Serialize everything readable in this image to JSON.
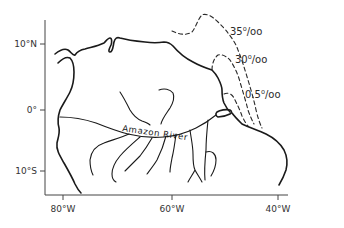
{
  "map": {
    "title": "",
    "feature_label": "Amazon River",
    "axes": {
      "y_ticks": [
        {
          "label": "10°N",
          "y": 44
        },
        {
          "label": "0°",
          "y": 110
        },
        {
          "label": "10°S",
          "y": 171
        }
      ],
      "x_ticks": [
        {
          "label": "80°W",
          "x": 63
        },
        {
          "label": "60°W",
          "x": 172
        },
        {
          "label": "40°W",
          "x": 278
        }
      ]
    },
    "isohalines": [
      {
        "value": "35",
        "unit": "0/00",
        "label": "35⁰/oo"
      },
      {
        "value": "30",
        "unit": "0/00",
        "label": "30⁰/oo"
      },
      {
        "value": "0.5",
        "unit": "0/00",
        "label": "0.5⁰/oo"
      }
    ],
    "colors": {
      "line": "#1a1a1a",
      "background": "#ffffff",
      "text": "#333333"
    }
  }
}
